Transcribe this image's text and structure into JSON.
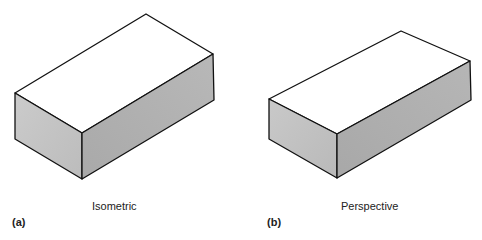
{
  "figure": {
    "panels": [
      {
        "id": "a",
        "label": "(a)",
        "caption": "Isometric",
        "projection": "isometric"
      },
      {
        "id": "b",
        "label": "(b)",
        "caption": "Perspective",
        "projection": "perspective"
      }
    ],
    "colors": {
      "top_face": "#ffffff",
      "left_face": "#c6c6c6",
      "right_face": "#b2b2b2",
      "edge": "#111111",
      "text": "#222222"
    }
  }
}
